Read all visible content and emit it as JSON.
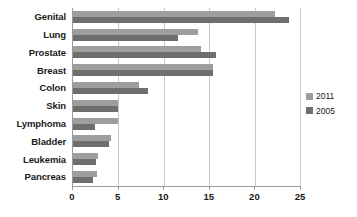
{
  "chart_data": {
    "type": "bar",
    "orientation": "horizontal",
    "title": "",
    "xlabel": "",
    "ylabel": "",
    "xlim": [
      0,
      25
    ],
    "xticks": [
      0,
      5,
      10,
      15,
      20,
      25
    ],
    "grid": true,
    "legend_position": "right",
    "categories": [
      "Genital",
      "Lung",
      "Prostate",
      "Breast",
      "Colon",
      "Skin",
      "Lymphoma",
      "Bladder",
      "Leukemia",
      "Pancreas"
    ],
    "series": [
      {
        "name": "2011",
        "color": "#9e9e9e",
        "values": [
          22.3,
          13.8,
          14.1,
          15.4,
          7.3,
          5.0,
          5.0,
          4.2,
          2.8,
          2.6
        ]
      },
      {
        "name": "2005",
        "color": "#6e6e6e",
        "values": [
          23.8,
          11.6,
          15.8,
          15.4,
          8.3,
          5.0,
          2.4,
          4.0,
          2.5,
          2.2
        ]
      }
    ]
  },
  "legend": {
    "items": [
      {
        "label": "2011"
      },
      {
        "label": "2005"
      }
    ]
  },
  "axis": {
    "tick_labels": [
      "0",
      "5",
      "10",
      "15",
      "20",
      "25"
    ]
  }
}
